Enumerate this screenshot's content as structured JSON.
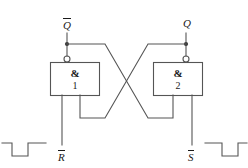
{
  "diagram": {
    "type": "logic-circuit-schematic",
    "line_color": "#555555",
    "text_color": "#1a1a1a",
    "background": "#ffffff",
    "gates": [
      {
        "id": "gate1",
        "symbol": "&",
        "number": "1",
        "function": "NAND",
        "inverting_bubble": true,
        "output_label": "Q̄"
      },
      {
        "id": "gate2",
        "symbol": "&",
        "number": "2",
        "function": "NAND",
        "inverting_bubble": true,
        "output_label": "Q"
      }
    ],
    "labels": {
      "output_left": {
        "text": "Q",
        "overbar": true
      },
      "output_right": {
        "text": "Q",
        "overbar": false
      },
      "input_left": {
        "text": "R",
        "overbar": true
      },
      "input_right": {
        "text": "S",
        "overbar": true
      }
    },
    "waveforms": [
      {
        "id": "waveform-left",
        "shape": "negative-pulse",
        "for_signal": "R̄"
      },
      {
        "id": "waveform-right",
        "shape": "negative-pulse",
        "for_signal": "S̄"
      }
    ]
  }
}
